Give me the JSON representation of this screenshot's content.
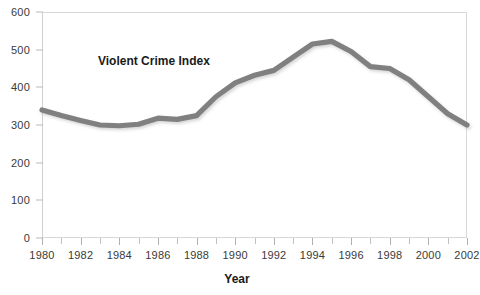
{
  "chart_data": {
    "type": "line",
    "title": "",
    "annotation": "Violent Crime Index",
    "xlabel": "Year",
    "ylabel": "",
    "grid": false,
    "legend": "none",
    "xlim": [
      1980,
      2002
    ],
    "ylim": [
      0,
      600
    ],
    "y_ticks": [
      0,
      100,
      200,
      300,
      400,
      500,
      600
    ],
    "x_ticks": [
      1980,
      1982,
      1984,
      1986,
      1988,
      1990,
      1992,
      1994,
      1996,
      1998,
      2000,
      2002
    ],
    "x_minor_ticks": [
      1981,
      1983,
      1985,
      1987,
      1989,
      1991,
      1993,
      1995,
      1997,
      1999,
      2001
    ],
    "line_color": "#808080",
    "x": [
      1980,
      1981,
      1982,
      1983,
      1984,
      1985,
      1986,
      1987,
      1988,
      1989,
      1990,
      1991,
      1992,
      1993,
      1994,
      1995,
      1996,
      1997,
      1998,
      1999,
      2000,
      2001,
      2002
    ],
    "values": [
      340,
      325,
      312,
      300,
      298,
      302,
      318,
      315,
      325,
      375,
      412,
      432,
      445,
      480,
      515,
      522,
      495,
      455,
      450,
      420,
      375,
      330,
      300
    ],
    "series": [
      {
        "name": "Violent Crime Index",
        "values": [
          340,
          325,
          312,
          300,
          298,
          302,
          318,
          315,
          325,
          375,
          412,
          432,
          445,
          480,
          515,
          522,
          495,
          455,
          450,
          420,
          375,
          330,
          300
        ]
      }
    ]
  },
  "axis": {
    "x_title": "Year"
  }
}
